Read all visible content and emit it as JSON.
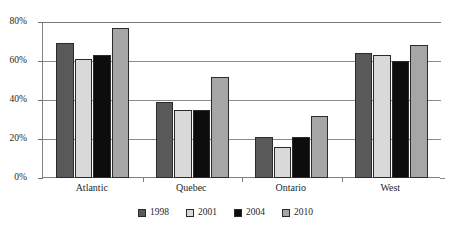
{
  "chart_data": {
    "type": "bar",
    "title": "",
    "subtitle": "",
    "xlabel": "",
    "ylabel": "",
    "categories": [
      "Atlantic",
      "Quebec",
      "Ontario",
      "West"
    ],
    "series": [
      {
        "name": "1998",
        "color": "#595959",
        "values": [
          69,
          39,
          21,
          64
        ]
      },
      {
        "name": "2001",
        "color": "#d9d9d9",
        "values": [
          61,
          35,
          16,
          63
        ]
      },
      {
        "name": "2004",
        "color": "#0d0d0d",
        "values": [
          63,
          35,
          21,
          60
        ]
      },
      {
        "name": "2010",
        "color": "#a6a6a6",
        "values": [
          77,
          52,
          32,
          68
        ]
      }
    ],
    "ylim": [
      0,
      80
    ],
    "ytick_values": [
      0,
      20,
      40,
      60,
      80
    ],
    "ytick_labels": [
      "0%",
      "20%",
      "40%",
      "60%",
      "80%"
    ],
    "grid": true,
    "legend_position": "bottom",
    "orientation": "vertical",
    "value_suffix": "%"
  },
  "axes": {
    "y_labels": [
      "80%",
      "60%",
      "40%",
      "20%",
      "0%"
    ]
  },
  "legend": {
    "entries": [
      {
        "label": "1998",
        "color": "#595959"
      },
      {
        "label": "2001",
        "color": "#d9d9d9"
      },
      {
        "label": "2004",
        "color": "#0d0d0d"
      },
      {
        "label": "2010",
        "color": "#a6a6a6"
      }
    ]
  }
}
